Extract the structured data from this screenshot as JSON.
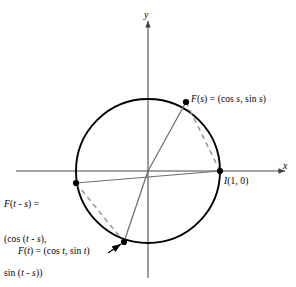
{
  "figure": {
    "axes": {
      "x_label": "x",
      "y_label": "y",
      "x_axis_name": "horizontal-axis",
      "y_axis_name": "vertical-axis"
    },
    "circle": {
      "center_x": 148,
      "center_y": 171,
      "radius": 72,
      "stroke": "#000000"
    },
    "colors": {
      "curve": "#000000",
      "radius_line": "#6b6b6b",
      "dashed_chord": "#9a9a9a",
      "axis": "#4a4a4a",
      "point": "#000000",
      "text": "#000000"
    },
    "points": [
      {
        "id": "F_s",
        "name": "point-f-of-s",
        "x": 186,
        "y": 102,
        "angle_deg": 44,
        "label_lines": [
          "F(s) = (cos s, sin s)"
        ]
      },
      {
        "id": "I",
        "name": "point-i",
        "x": 220,
        "y": 171,
        "angle_deg": 0,
        "label_lines": [
          "I(1, 0)"
        ]
      },
      {
        "id": "F_t_minus_s",
        "name": "point-f-of-t-minus-s",
        "x": 76,
        "y": 183,
        "angle_deg": 189,
        "label_lines": [
          "F(t - s) =",
          "(cos (t - s),",
          "sin (t - s))"
        ]
      },
      {
        "id": "F_t",
        "name": "point-f-of-t",
        "x": 124,
        "y": 242,
        "angle_deg": 251,
        "label_lines": [
          "F(t) = (cos t, sin t)"
        ]
      }
    ],
    "labels": {
      "f_of_s": "F(s) = (cos s, sin s)",
      "f_of_s_fn": "F",
      "f_of_s_arg": "(s)",
      "f_of_s_eq": "= (cos",
      "f_of_s_var1": "s",
      "f_of_s_comma": ", sin",
      "f_of_s_var2": "s",
      "f_of_s_close": ")",
      "i_point": "I(1, 0)",
      "i_point_fn": "I",
      "i_point_arg": "(1, 0)",
      "f_t_minus_s_line1": "F(t - s) =",
      "f_t_minus_s_line2": "(cos (t - s),",
      "f_t_minus_s_line3": "sin (t - s))",
      "f_of_t": "F(t) = (cos t, sin t)",
      "axis_x": "x",
      "axis_y": "y"
    },
    "segments": [
      {
        "name": "radius-to-f-of-s",
        "from": "origin",
        "to": "F_s",
        "style": "solid",
        "color": "#6b6b6b"
      },
      {
        "name": "radius-to-f-of-t",
        "from": "origin",
        "to": "F_t",
        "style": "solid",
        "color": "#6b6b6b"
      },
      {
        "name": "chord-f-of-t-minus-s-to-i",
        "from": "F_t_minus_s",
        "to": "I",
        "style": "solid",
        "color": "#6b6b6b"
      },
      {
        "name": "dashed-chord-f-of-s-to-i",
        "from": "F_s",
        "to": "I",
        "style": "dashed",
        "color": "#9a9a9a"
      },
      {
        "name": "dashed-chord-f-of-t-minus-s-to-f-of-t",
        "from": "F_t_minus_s",
        "to": "F_t",
        "style": "dashed",
        "color": "#9a9a9a"
      }
    ],
    "annotations": [
      {
        "name": "leader-line-f-of-t",
        "type": "arrow",
        "from_x": 110,
        "from_y": 252,
        "to_x": 122,
        "to_y": 244
      }
    ]
  }
}
